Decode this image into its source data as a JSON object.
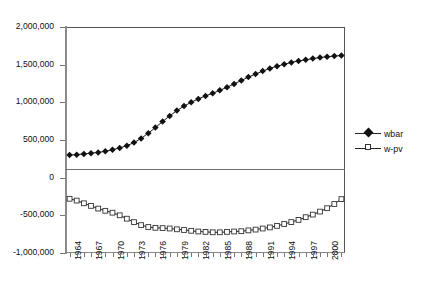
{
  "chart_data": {
    "type": "line",
    "title": "",
    "xlabel": "",
    "ylabel": "",
    "grid": false,
    "legend_position": "right",
    "ylim": [
      -1000000,
      2000000
    ],
    "ytick_labels": [
      "2,000,000",
      "1,500,000",
      "1,000,000",
      "500,000",
      "0",
      "-500,000",
      "-1,000,000"
    ],
    "ytick_values": [
      2000000,
      1500000,
      1000000,
      500000,
      0,
      -500000,
      -1000000
    ],
    "xtick_labels": [
      "1964",
      "1967",
      "1970",
      "1973",
      "1976",
      "1979",
      "1982",
      "1985",
      "1988",
      "1991",
      "1994",
      "1997",
      "2000"
    ],
    "x": [
      1964,
      1965,
      1966,
      1967,
      1968,
      1969,
      1970,
      1971,
      1972,
      1973,
      1974,
      1975,
      1976,
      1977,
      1978,
      1979,
      1980,
      1981,
      1982,
      1983,
      1984,
      1985,
      1986,
      1987,
      1988,
      1989,
      1990,
      1991,
      1992,
      1993,
      1994,
      1995,
      1996,
      1997,
      1998,
      1999,
      2000,
      2001,
      2002
    ],
    "series": [
      {
        "name": "wbar",
        "marker": "filled-diamond",
        "values": [
          300000,
          305000,
          315000,
          325000,
          335000,
          350000,
          370000,
          395000,
          425000,
          465000,
          520000,
          590000,
          665000,
          745000,
          820000,
          890000,
          950000,
          1000000,
          1045000,
          1085000,
          1120000,
          1160000,
          1200000,
          1245000,
          1290000,
          1335000,
          1375000,
          1415000,
          1450000,
          1480000,
          1505000,
          1530000,
          1550000,
          1565000,
          1580000,
          1595000,
          1605000,
          1615000,
          1620000
        ]
      },
      {
        "name": "w-pv",
        "marker": "open-square",
        "values": [
          -280000,
          -305000,
          -340000,
          -375000,
          -410000,
          -440000,
          -465000,
          -500000,
          -545000,
          -590000,
          -630000,
          -655000,
          -665000,
          -670000,
          -675000,
          -685000,
          -695000,
          -705000,
          -715000,
          -720000,
          -725000,
          -725000,
          -720000,
          -715000,
          -710000,
          -700000,
          -690000,
          -675000,
          -660000,
          -640000,
          -615000,
          -590000,
          -560000,
          -525000,
          -490000,
          -450000,
          -405000,
          -350000,
          -285000
        ]
      }
    ]
  },
  "legend": {
    "items": [
      {
        "label": "wbar"
      },
      {
        "label": "w-pv"
      }
    ]
  }
}
